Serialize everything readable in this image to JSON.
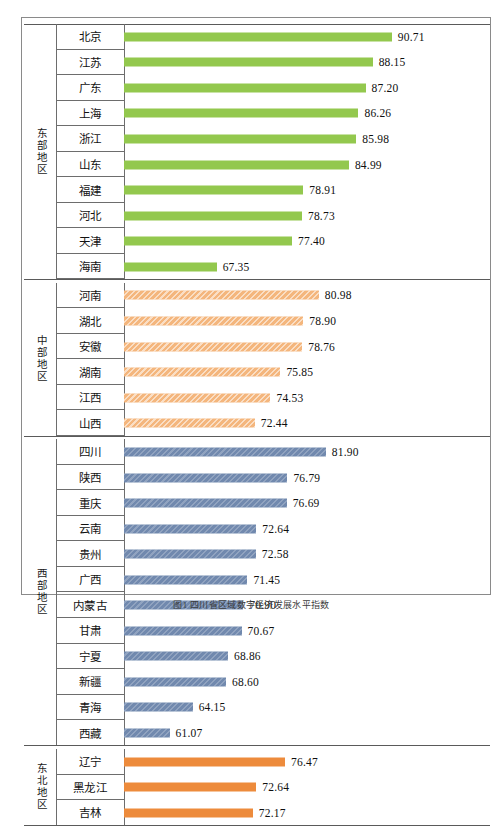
{
  "caption": "图1  四川省区域数字经济发展水平指数",
  "colors": {
    "east": "#93c84e",
    "central": "#f4b67d",
    "west": "#7189ae",
    "northeast": "#ed8b3c",
    "frame": "#8a8a8a",
    "gridline": "#6d6d6d"
  },
  "chart_data": {
    "type": "bar",
    "orientation": "horizontal",
    "title": "图1  四川省区域数字经济发展水平指数",
    "xlabel": "",
    "ylabel": "",
    "grid": false,
    "legend_position": "none",
    "value_labels": true,
    "xlim": [
      55,
      95
    ],
    "categories": [
      "北京",
      "江苏",
      "广东",
      "上海",
      "浙江",
      "山东",
      "福建",
      "河北",
      "天津",
      "海南",
      "河南",
      "湖北",
      "安徽",
      "湖南",
      "江西",
      "山西",
      "四川",
      "陕西",
      "重庆",
      "云南",
      "贵州",
      "广西",
      "内蒙古",
      "甘肃",
      "宁夏",
      "新疆",
      "青海",
      "西藏",
      "辽宁",
      "黑龙江",
      "吉林"
    ],
    "values": [
      90.71,
      88.15,
      87.2,
      86.26,
      85.98,
      84.99,
      78.91,
      78.73,
      77.4,
      67.35,
      80.98,
      78.9,
      78.76,
      75.85,
      74.53,
      72.44,
      81.9,
      76.79,
      76.69,
      72.64,
      72.58,
      71.45,
      70.9,
      70.67,
      68.86,
      68.6,
      64.15,
      61.07,
      76.47,
      72.64,
      72.17
    ],
    "groups": [
      {
        "name": "东部地区",
        "color_key": "east",
        "items": [
          {
            "label": "北京",
            "value": 90.71,
            "value_text": "90.71"
          },
          {
            "label": "江苏",
            "value": 88.15,
            "value_text": "88.15"
          },
          {
            "label": "广东",
            "value": 87.2,
            "value_text": "87.20"
          },
          {
            "label": "上海",
            "value": 86.26,
            "value_text": "86.26"
          },
          {
            "label": "浙江",
            "value": 85.98,
            "value_text": "85.98"
          },
          {
            "label": "山东",
            "value": 84.99,
            "value_text": "84.99"
          },
          {
            "label": "福建",
            "value": 78.91,
            "value_text": "78.91"
          },
          {
            "label": "河北",
            "value": 78.73,
            "value_text": "78.73"
          },
          {
            "label": "天津",
            "value": 77.4,
            "value_text": "77.40"
          },
          {
            "label": "海南",
            "value": 67.35,
            "value_text": "67.35"
          }
        ]
      },
      {
        "name": "中部地区",
        "color_key": "central",
        "items": [
          {
            "label": "河南",
            "value": 80.98,
            "value_text": "80.98"
          },
          {
            "label": "湖北",
            "value": 78.9,
            "value_text": "78.90"
          },
          {
            "label": "安徽",
            "value": 78.76,
            "value_text": "78.76"
          },
          {
            "label": "湖南",
            "value": 75.85,
            "value_text": "75.85"
          },
          {
            "label": "江西",
            "value": 74.53,
            "value_text": "74.53"
          },
          {
            "label": "山西",
            "value": 72.44,
            "value_text": "72.44"
          }
        ]
      },
      {
        "name": "西部地区",
        "color_key": "west",
        "items": [
          {
            "label": "四川",
            "value": 81.9,
            "value_text": "81.90"
          },
          {
            "label": "陕西",
            "value": 76.79,
            "value_text": "76.79"
          },
          {
            "label": "重庆",
            "value": 76.69,
            "value_text": "76.69"
          },
          {
            "label": "云南",
            "value": 72.64,
            "value_text": "72.64"
          },
          {
            "label": "贵州",
            "value": 72.58,
            "value_text": "72.58"
          },
          {
            "label": "广西",
            "value": 71.45,
            "value_text": "71.45"
          },
          {
            "label": "内蒙古",
            "value": 70.9,
            "value_text": "70.90"
          },
          {
            "label": "甘肃",
            "value": 70.67,
            "value_text": "70.67"
          },
          {
            "label": "宁夏",
            "value": 68.86,
            "value_text": "68.86"
          },
          {
            "label": "新疆",
            "value": 68.6,
            "value_text": "68.60"
          },
          {
            "label": "青海",
            "value": 64.15,
            "value_text": "64.15"
          },
          {
            "label": "西藏",
            "value": 61.07,
            "value_text": "61.07"
          }
        ]
      },
      {
        "name": "东北地区",
        "color_key": "northeast",
        "items": [
          {
            "label": "辽宁",
            "value": 76.47,
            "value_text": "76.47"
          },
          {
            "label": "黑龙江",
            "value": 72.64,
            "value_text": "72.64"
          },
          {
            "label": "吉林",
            "value": 72.17,
            "value_text": "72.17"
          }
        ]
      }
    ]
  }
}
